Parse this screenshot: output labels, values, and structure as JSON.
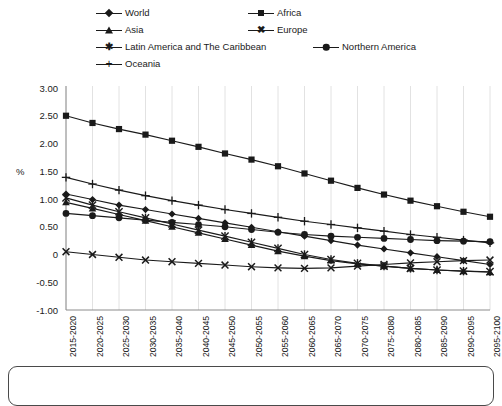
{
  "chart_data": {
    "type": "line",
    "title": "",
    "xlabel": "",
    "ylabel": "%",
    "ylim": [
      -1.0,
      3.0
    ],
    "ytick_labels": [
      "3.00",
      "2.50",
      "2.00",
      "1.50",
      "1.00",
      "0.50",
      "0",
      "-0.50",
      "-1.00"
    ],
    "ytick_values": [
      3.0,
      2.5,
      2.0,
      1.5,
      1.0,
      0.5,
      0,
      -0.5,
      -1.0
    ],
    "grid": "vertical",
    "legend_position": "top",
    "categories": [
      "2015-2020",
      "2020-2025",
      "2025-2030",
      "2030-2035",
      "2035-2040",
      "2040-2045",
      "2045-2050",
      "2050-2055",
      "2055-2060",
      "2060-2065",
      "2065-2070",
      "2070-2075",
      "2075-2080",
      "2080-2085",
      "2085-2090",
      "2090-2095",
      "2095-2100"
    ],
    "series": [
      {
        "name": "World",
        "marker": "diamond",
        "values": [
          1.09,
          0.99,
          0.89,
          0.81,
          0.73,
          0.65,
          0.57,
          0.49,
          0.41,
          0.33,
          0.25,
          0.17,
          0.1,
          0.03,
          -0.04,
          -0.11,
          -0.18
        ]
      },
      {
        "name": "Africa",
        "marker": "square",
        "values": [
          2.5,
          2.37,
          2.26,
          2.16,
          2.05,
          1.94,
          1.82,
          1.71,
          1.59,
          1.46,
          1.33,
          1.2,
          1.08,
          0.97,
          0.87,
          0.77,
          0.68
        ]
      },
      {
        "name": "Asia",
        "marker": "triangle",
        "values": [
          0.94,
          0.83,
          0.72,
          0.61,
          0.5,
          0.39,
          0.28,
          0.17,
          0.06,
          -0.03,
          -0.11,
          -0.17,
          -0.21,
          -0.25,
          -0.28,
          -0.3,
          -0.32
        ]
      },
      {
        "name": "Europe",
        "marker": "x",
        "values": [
          0.05,
          0.0,
          -0.05,
          -0.1,
          -0.13,
          -0.16,
          -0.19,
          -0.22,
          -0.24,
          -0.25,
          -0.24,
          -0.21,
          -0.18,
          -0.15,
          -0.13,
          -0.11,
          -0.1
        ]
      },
      {
        "name": "Latin America and The Caribbean",
        "marker": "star",
        "values": [
          1.02,
          0.89,
          0.77,
          0.66,
          0.55,
          0.44,
          0.33,
          0.22,
          0.11,
          0.0,
          -0.09,
          -0.16,
          -0.21,
          -0.25,
          -0.28,
          -0.3,
          -0.31
        ]
      },
      {
        "name": "Northern America",
        "marker": "circle",
        "values": [
          0.74,
          0.7,
          0.66,
          0.62,
          0.58,
          0.54,
          0.5,
          0.45,
          0.4,
          0.36,
          0.33,
          0.31,
          0.29,
          0.27,
          0.25,
          0.24,
          0.23
        ]
      },
      {
        "name": "Oceania",
        "marker": "plus",
        "values": [
          1.39,
          1.27,
          1.16,
          1.06,
          0.97,
          0.89,
          0.81,
          0.74,
          0.67,
          0.6,
          0.54,
          0.48,
          0.42,
          0.36,
          0.31,
          0.26,
          0.21
        ]
      }
    ]
  },
  "legend": {
    "items": [
      {
        "label": "World",
        "marker": "diamond"
      },
      {
        "label": "Africa",
        "marker": "square"
      },
      {
        "label": "Asia",
        "marker": "triangle"
      },
      {
        "label": "Europe",
        "marker": "x"
      },
      {
        "label": "Latin America and The Caribbean",
        "marker": "star"
      },
      {
        "label": "Northern America",
        "marker": "circle"
      },
      {
        "label": "Oceania",
        "marker": "plus"
      }
    ]
  },
  "colors": {
    "series": "#1a1a1a",
    "grid": "#e2e2e2",
    "axis": "#8c8c8c",
    "background": "#ffffff"
  }
}
